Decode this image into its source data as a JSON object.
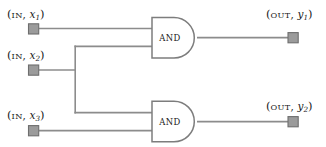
{
  "diagram": {
    "type": "logic-circuit",
    "width": 326,
    "height": 147,
    "background_color": "#ffffff",
    "wire_color": "#8c8c8c",
    "gate_stroke_color": "#7d7d7d",
    "terminal_fill_color": "#9b9b9b",
    "terminal_stroke_color": "#6e6e6e",
    "text_color": "#1a1a1a"
  },
  "inputs": [
    {
      "id": "x1",
      "prefix": "(",
      "kind": "IN",
      "comma": ", ",
      "var": "x",
      "subscript": "1",
      "suffix": ")",
      "label": "(IN, x1)",
      "x": 33,
      "y": 29
    },
    {
      "id": "x2",
      "prefix": "(",
      "kind": "IN",
      "comma": ", ",
      "var": "x",
      "subscript": "2",
      "suffix": ")",
      "label": "(IN, x2)",
      "x": 33,
      "y": 70
    },
    {
      "id": "x3",
      "prefix": "(",
      "kind": "IN",
      "comma": ", ",
      "var": "x",
      "subscript": "3",
      "suffix": ")",
      "label": "(IN, x3)",
      "x": 33,
      "y": 130
    }
  ],
  "outputs": [
    {
      "id": "y1",
      "prefix": "(",
      "kind": "OUT",
      "comma": ", ",
      "var": "y",
      "subscript": "1",
      "suffix": ")",
      "label": "(OUT, y1)",
      "x": 293,
      "y": 38
    },
    {
      "id": "y2",
      "prefix": "(",
      "kind": "OUT",
      "comma": ", ",
      "var": "y",
      "subscript": "2",
      "suffix": ")",
      "label": "(OUT, y2)",
      "x": 293,
      "y": 122
    }
  ],
  "gates": [
    {
      "id": "and1",
      "label": "AND",
      "left": 151,
      "top": 17,
      "right": 197,
      "bottom": 58,
      "input_ys": [
        27,
        47
      ],
      "output_y": 38
    },
    {
      "id": "and2",
      "label": "AND",
      "left": 151,
      "top": 100,
      "right": 197,
      "bottom": 141,
      "input_ys": [
        113,
        131
      ],
      "output_y": 122
    }
  ],
  "branch": {
    "id": "x2-fanout",
    "x": 75,
    "top_y": 46,
    "bottom_y": 113
  }
}
